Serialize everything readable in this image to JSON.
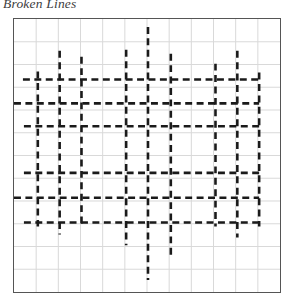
{
  "figure": {
    "title": "Broken Lines",
    "background_color": "#ffffff"
  },
  "plot": {
    "frame": {
      "x": 13,
      "y": 18,
      "width": 268,
      "height": 275
    },
    "border_color": "#555555",
    "grid_color": "#d9d9d9",
    "line_color": "#1a1a1a"
  },
  "chart_data": {
    "type": "line",
    "title": "Broken Lines",
    "subtitle": "",
    "xlabel": "",
    "ylabel": "",
    "grid": true,
    "legend": null,
    "xlim": [
      0,
      12
    ],
    "ylim": [
      0,
      12
    ],
    "grid_columns": 12,
    "grid_rows": 12,
    "dash_pattern": {
      "dash": 7,
      "gap": 4.5,
      "width": 2.6
    },
    "series": [
      {
        "name": "v1",
        "orientation": "vertical",
        "x": 24,
        "y0": 53,
        "y1": 209
      },
      {
        "name": "v2",
        "orientation": "vertical",
        "x": 46,
        "y0": 32,
        "y1": 217
      },
      {
        "name": "v3",
        "orientation": "vertical",
        "x": 68,
        "y0": 38,
        "y1": 209
      },
      {
        "name": "v4",
        "orientation": "vertical",
        "x": 113,
        "y0": 31,
        "y1": 228
      },
      {
        "name": "v5",
        "orientation": "vertical",
        "x": 135,
        "y0": 8,
        "y1": 263
      },
      {
        "name": "v6",
        "orientation": "vertical",
        "x": 158,
        "y0": 35,
        "y1": 239
      },
      {
        "name": "v7",
        "orientation": "vertical",
        "x": 203,
        "y0": 45,
        "y1": 209
      },
      {
        "name": "v8",
        "orientation": "vertical",
        "x": 225,
        "y0": 32,
        "y1": 220
      },
      {
        "name": "v9",
        "orientation": "vertical",
        "x": 247,
        "y0": 54,
        "y1": 209
      },
      {
        "name": "h1",
        "orientation": "horizontal",
        "y": 61,
        "x0": 9,
        "x1": 250
      },
      {
        "name": "h2",
        "orientation": "horizontal",
        "y": 85,
        "x0": 0,
        "x1": 247
      },
      {
        "name": "h3",
        "orientation": "horizontal",
        "y": 108,
        "x0": 10,
        "x1": 250
      },
      {
        "name": "h4",
        "orientation": "horizontal",
        "y": 155,
        "x0": 10,
        "x1": 250
      },
      {
        "name": "h5",
        "orientation": "horizontal",
        "y": 180,
        "x0": 0,
        "x1": 247
      },
      {
        "name": "h6",
        "orientation": "horizontal",
        "y": 205,
        "x0": 10,
        "x1": 250
      }
    ]
  }
}
